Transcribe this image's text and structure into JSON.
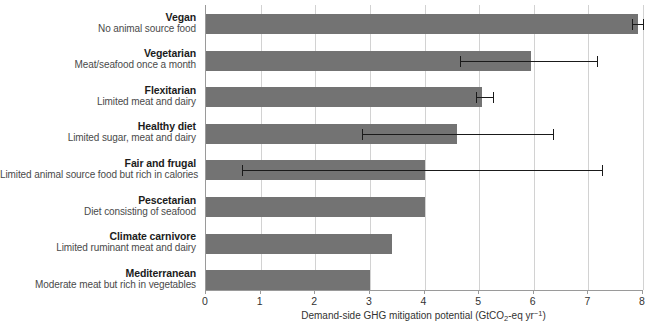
{
  "chart_data": {
    "type": "bar",
    "orientation": "horizontal",
    "title": "",
    "xlabel": "Demand-side GHG mitigation potential (GtCO2-eq yr-1)",
    "xlabel_parts": {
      "before": "Demand-side GHG mitigation potential (GtCO",
      "sub": "2",
      "middle": "-eq yr",
      "sup": "−1",
      "after": ")"
    },
    "ylabel": "",
    "xlim": [
      0,
      8
    ],
    "xticks": [
      0,
      1,
      2,
      3,
      4,
      5,
      6,
      7,
      8
    ],
    "xtick_labels": [
      "0",
      "1",
      "2",
      "3",
      "4",
      "5",
      "6",
      "7",
      "8"
    ],
    "grid": true,
    "legend": false,
    "bar_color": "#737373",
    "error_color": "#1a1a1a",
    "categories": [
      "Vegan",
      "Vegetarian",
      "Flexitarian",
      "Healthy diet",
      "Fair and frugal",
      "Pescetarian",
      "Climate carnivore",
      "Mediterranean"
    ],
    "category_descriptions": [
      "No animal source food",
      "Meat/seafood once a month",
      "Limited meat and dairy",
      "Limited sugar, meat and dairy",
      "Limited animal source food but rich in calories",
      "Diet consisting of seafood",
      "Limited ruminant meat and dairy",
      "Moderate meat but rich in vegetables"
    ],
    "values": [
      7.9,
      5.95,
      5.05,
      4.6,
      4.0,
      4.0,
      3.4,
      3.0
    ],
    "error_low": [
      7.8,
      4.65,
      4.95,
      2.85,
      0.65,
      null,
      null,
      null
    ],
    "error_high": [
      8.0,
      7.15,
      5.25,
      6.35,
      7.25,
      null,
      null,
      null
    ]
  }
}
